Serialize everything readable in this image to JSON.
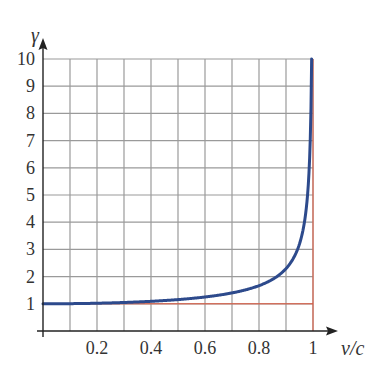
{
  "chart_data": {
    "type": "line",
    "title": "",
    "xlabel": "v/c",
    "ylabel": "γ",
    "xlim": [
      0,
      1
    ],
    "ylim": [
      0,
      10
    ],
    "x_ticks": [
      "0.2",
      "0.4",
      "0.6",
      "0.8",
      "1"
    ],
    "y_ticks": [
      "1",
      "2",
      "3",
      "4",
      "5",
      "6",
      "7",
      "8",
      "9",
      "10"
    ],
    "grid": true,
    "series": [
      {
        "name": "gamma = 1/sqrt(1-(v/c)^2)",
        "color": "#2d4a8c",
        "x": [
          0,
          0.2,
          0.4,
          0.6,
          0.8,
          0.9,
          0.95,
          0.98,
          0.995
        ],
        "y": [
          1.0,
          1.02,
          1.09,
          1.25,
          1.67,
          2.29,
          3.2,
          5.03,
          10.0
        ]
      }
    ],
    "reference_lines": [
      {
        "type": "horizontal",
        "y": 1,
        "color": "#e0553a"
      },
      {
        "type": "vertical",
        "x": 1,
        "color": "#e0553a"
      }
    ],
    "colors": {
      "grid": "#9a9a9a",
      "axis": "#222222",
      "curve": "#2d4a8c",
      "asymptote": "#e0553a"
    }
  }
}
